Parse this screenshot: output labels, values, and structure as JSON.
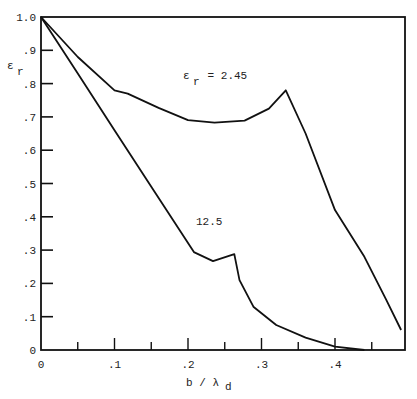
{
  "chart_data": {
    "type": "line",
    "title": "",
    "xlabel": "b / λd",
    "ylabel": "εr",
    "xlim": [
      0,
      0.49
    ],
    "ylim": [
      0,
      1.0
    ],
    "grid": false,
    "legend": "none (curves labeled inline)",
    "x_ticks_major": [
      0,
      0.1,
      0.2,
      0.3,
      0.4
    ],
    "x_tick_labels": [
      "0",
      ".1",
      ".2",
      ".3",
      ".4"
    ],
    "y_ticks": [
      0,
      0.1,
      0.2,
      0.3,
      0.4,
      0.5,
      0.6,
      0.7,
      0.8,
      0.9,
      1.0
    ],
    "y_tick_labels": [
      "0",
      ".1",
      ".2",
      ".3",
      ".4",
      ".5",
      ".6",
      ".7",
      ".8",
      ".9",
      "1.0"
    ],
    "series": [
      {
        "name": "εr = 2.45",
        "x": [
          0,
          0.05,
          0.1,
          0.118,
          0.16,
          0.2,
          0.236,
          0.277,
          0.31,
          0.333,
          0.36,
          0.4,
          0.44,
          0.47,
          0.49
        ],
        "y": [
          1.0,
          0.88,
          0.78,
          0.77,
          0.727,
          0.69,
          0.683,
          0.689,
          0.725,
          0.78,
          0.65,
          0.42,
          0.28,
          0.15,
          0.06
        ]
      },
      {
        "name": "12.5",
        "x": [
          0,
          0.05,
          0.1,
          0.15,
          0.208,
          0.234,
          0.263,
          0.27,
          0.289,
          0.32,
          0.36,
          0.4,
          0.44
        ],
        "y": [
          1.0,
          0.83,
          0.66,
          0.49,
          0.294,
          0.267,
          0.288,
          0.21,
          0.13,
          0.075,
          0.037,
          0.01,
          0.0
        ]
      }
    ],
    "annotations": [
      {
        "text": "εr = 2.45",
        "x": 0.27,
        "y": 0.835
      },
      {
        "text": "12.5",
        "x": 0.215,
        "y": 0.345
      }
    ]
  },
  "labels": {
    "ylabel_main": "ε",
    "ylabel_sub": "r",
    "xlabel_main": "b / λ",
    "xlabel_sub": "d",
    "ann_upper_main": "ε",
    "ann_upper_sub": "r",
    "ann_upper_rest": " = 2.45",
    "ann_lower": "12.5"
  }
}
